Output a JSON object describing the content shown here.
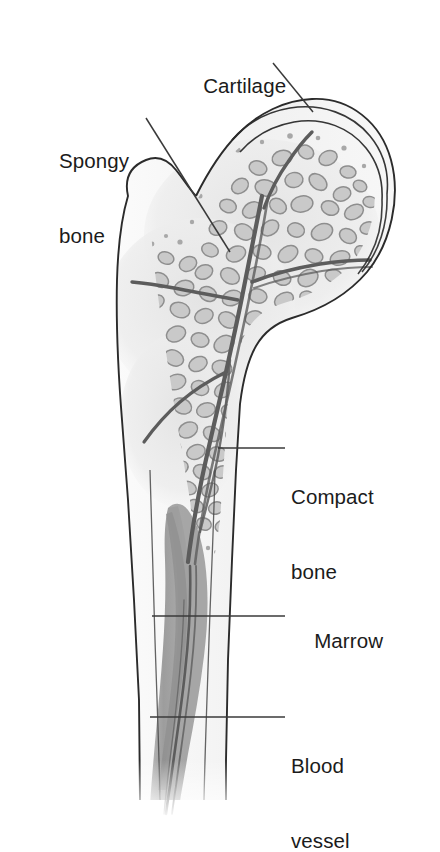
{
  "figure": {
    "background_color": "#ffffff",
    "ink_color": "#2b2b2b"
  },
  "labels": [
    {
      "id": "cartilage",
      "text": "Cartilage",
      "lines": [
        "Cartilage"
      ]
    },
    {
      "id": "spongy_bone",
      "text": "Spongy bone",
      "lines": [
        "Spongy",
        "bone"
      ]
    },
    {
      "id": "compact_bone",
      "text": "Compact bone",
      "lines": [
        "Compact",
        "bone"
      ]
    },
    {
      "id": "marrow",
      "text": "Marrow",
      "lines": [
        "Marrow"
      ]
    },
    {
      "id": "blood_vessel",
      "text": "Blood vessel",
      "lines": [
        "Blood",
        "vessel"
      ]
    }
  ],
  "label_text": {
    "cartilage": "Cartilage",
    "spongy_line1": "Spongy",
    "spongy_line2": "bone",
    "compact_line1": "Compact",
    "compact_line2": "bone",
    "marrow": "Marrow",
    "blood_line1": "Blood",
    "blood_line2": "vessel"
  },
  "colors": {
    "outline": "#2b2b2b",
    "leader_line": "#3a3a3a",
    "compact_bone_fill": "#f2f2f2",
    "cartilage_fill": "#f7f7f7",
    "spongy_field": "#ededed",
    "trabecula_fill": "#c9c9c9",
    "trabecula_stroke": "#8e8e8e",
    "marrow_fill": "#9b9b9b",
    "vessel_stroke": "#5a5a5a",
    "text": "#1b1b1b"
  },
  "structures": [
    {
      "name": "femoral-head",
      "description": "rounded proximal head capped by cartilage"
    },
    {
      "name": "greater-trochanter",
      "description": "lobed bony prominence on the upper left"
    },
    {
      "name": "cartilage-cap",
      "description": "thin crescent layer over the femoral head"
    },
    {
      "name": "spongy-bone-region",
      "description": "trabecular blob network filling head and neck"
    },
    {
      "name": "compact-bone-wall",
      "description": "pale dense outer shell along the shaft"
    },
    {
      "name": "marrow-cavity",
      "description": "gray medullary canal running down the shaft"
    },
    {
      "name": "blood-vessel-tree",
      "description": "branching vessels through spongy bone into the marrow"
    }
  ]
}
